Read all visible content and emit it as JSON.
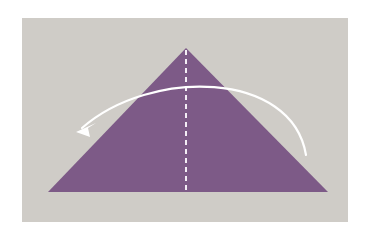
{
  "diagram": {
    "type": "origami-fold-step",
    "colors": {
      "page_background": "#ffffff",
      "panel_background": "#cfccc7",
      "paper": "#7d5a87",
      "fold_line": "#f4eef6",
      "arrow": "#ffffff"
    },
    "triangle": {
      "apex": [
        186,
        48
      ],
      "base_left": [
        48,
        192
      ],
      "base_right": [
        328,
        192
      ]
    },
    "fold_line": {
      "style": "dashed",
      "from": [
        186,
        50
      ],
      "to": [
        186,
        192
      ],
      "dash": "5 4"
    },
    "arrow": {
      "direction": "right-to-left",
      "start": [
        306,
        155
      ],
      "control1": [
        292,
        70
      ],
      "control2": [
        150,
        68
      ],
      "end": [
        80,
        129
      ]
    }
  }
}
